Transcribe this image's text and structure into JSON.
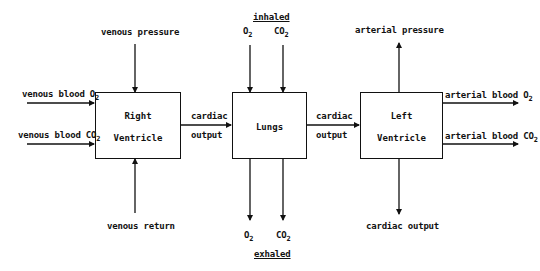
{
  "diagram": {
    "type": "block-diagram",
    "blocks": [
      {
        "id": "right_ventricle",
        "line1": "Right",
        "line2": "Ventricle"
      },
      {
        "id": "lungs",
        "label": "Lungs"
      },
      {
        "id": "left_ventricle",
        "line1": "Left",
        "line2": "Ventricle"
      }
    ],
    "labels": {
      "venous_pressure": "venous pressure",
      "venous_blood_o2": "venous blood O",
      "venous_blood_co2": "venous blood CO",
      "venous_return": "venous return",
      "cardiac": "cardiac",
      "output": "output",
      "inhaled": "inhaled",
      "exhaled": "exhaled",
      "o": "O",
      "co": "CO",
      "sub2": "2",
      "arterial_pressure": "arterial pressure",
      "arterial_blood_o2": "arterial blood O",
      "arterial_blood_co2": "arterial blood CO",
      "cardiac_output": "cardiac output"
    },
    "edges": [
      {
        "from": "venous pressure",
        "to": "Right Ventricle"
      },
      {
        "from": "venous blood O2",
        "to": "Right Ventricle"
      },
      {
        "from": "venous blood CO2",
        "to": "Right Ventricle"
      },
      {
        "from": "venous return",
        "to": "Right Ventricle"
      },
      {
        "from": "Right Ventricle",
        "to": "Lungs",
        "label": "cardiac output"
      },
      {
        "from": "inhaled O2",
        "to": "Lungs"
      },
      {
        "from": "inhaled CO2",
        "to": "Lungs"
      },
      {
        "from": "Lungs",
        "to": "exhaled O2"
      },
      {
        "from": "Lungs",
        "to": "exhaled CO2"
      },
      {
        "from": "Lungs",
        "to": "Left Ventricle",
        "label": "cardiac output"
      },
      {
        "from": "Left Ventricle",
        "to": "arterial pressure"
      },
      {
        "from": "Left Ventricle",
        "to": "arterial blood O2"
      },
      {
        "from": "Left Ventricle",
        "to": "arterial blood CO2"
      },
      {
        "from": "Left Ventricle",
        "to": "cardiac output"
      }
    ]
  }
}
